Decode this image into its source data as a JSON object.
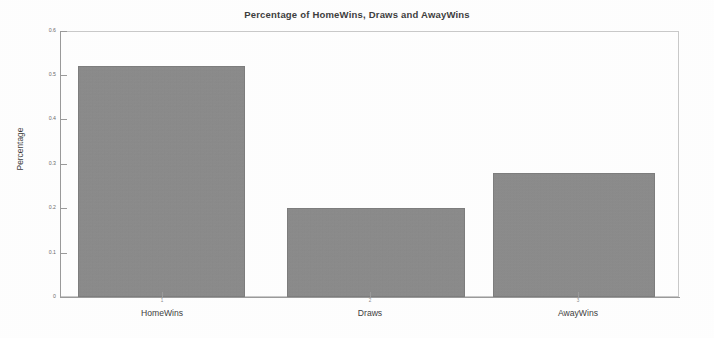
{
  "chart_data": {
    "type": "bar",
    "title": "Percentage of HomeWins, Draws and AwayWins",
    "xlabel": "",
    "ylabel": "Percentage",
    "categories": [
      "HomeWins",
      "Draws",
      "AwayWins"
    ],
    "values": [
      0.52,
      0.2,
      0.28
    ],
    "tick_numbers": [
      "1",
      "2",
      "3"
    ],
    "ylim": [
      0,
      0.6
    ],
    "yticks": [
      "0.6",
      "0.5",
      "0.4",
      "0.3",
      "0.2",
      "0.1",
      "0"
    ],
    "ytick_values": [
      0.6,
      0.5,
      0.4,
      0.3,
      0.2,
      0.1,
      0
    ],
    "grid": false,
    "legend": false,
    "bar_color": "#8a8a8a",
    "axis_color": "#9a9a9a",
    "frame_color": "#c9c9c9",
    "background": "#ffffff"
  }
}
